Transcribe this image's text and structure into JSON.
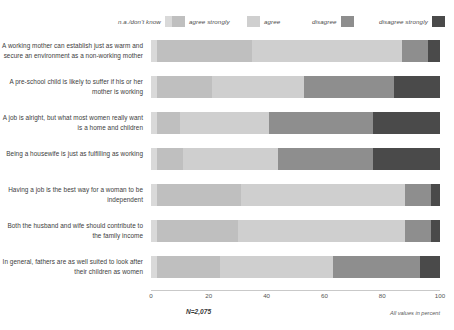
{
  "legend": {
    "entries": [
      {
        "label": "n.a./don't know",
        "color": "#d9d9d9",
        "label_side": "left",
        "x": 118
      },
      {
        "label": "agree strongly",
        "color": "#bfbfbf",
        "label_side": "right",
        "x": 172
      },
      {
        "label": "agree",
        "color": "#cfcfcf",
        "label_side": "right",
        "x": 247
      },
      {
        "label": "disagree",
        "color": "#8e8e8e",
        "label_side": "left",
        "x": 312
      },
      {
        "label": "disagree strongly",
        "color": "#4a4a4a",
        "label_side": "left",
        "x": 379
      }
    ]
  },
  "footnote": {
    "sample": "N=2,075",
    "units": "All values in percent"
  },
  "chart_data": {
    "type": "bar",
    "title": "",
    "subtitle": "",
    "xlabel": "",
    "ylabel": "",
    "orientation": "horizontal",
    "stacked": true,
    "normalized": true,
    "grid": false,
    "legend_position": "top",
    "xlim": [
      0,
      100
    ],
    "xticks": [
      0,
      20,
      40,
      60,
      80,
      100
    ],
    "categories": [
      "A working mother can establish just as warm and secure an environment as a non-working mother",
      "A pre-school child is likely to suffer if his or her mother is working",
      "A job is alright, but what most women really want is a home and children",
      "Being a housewife is just as fulfilling as working",
      "Having a job is the best way for a woman to be independent",
      "Both the husband and wife should contribute to the family income",
      "In general, fathers are as well suited to look after their children as women"
    ],
    "series": [
      {
        "name": "n.a./don't know",
        "color": "#d9d9d9",
        "values": [
          2,
          2,
          2,
          2,
          2,
          2,
          2
        ]
      },
      {
        "name": "agree strongly",
        "color": "#bfbfbf",
        "values": [
          33,
          19,
          8,
          9,
          29,
          28,
          22
        ]
      },
      {
        "name": "agree",
        "color": "#cfcfcf",
        "values": [
          52,
          32,
          31,
          33,
          57,
          58,
          39
        ]
      },
      {
        "name": "disagree",
        "color": "#8e8e8e",
        "values": [
          9,
          31,
          36,
          33,
          9,
          9,
          30
        ]
      },
      {
        "name": "disagree strongly",
        "color": "#4a4a4a",
        "values": [
          4,
          16,
          23,
          23,
          3,
          3,
          7
        ]
      }
    ]
  }
}
